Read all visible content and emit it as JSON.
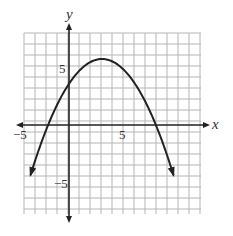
{
  "chart_data": {
    "type": "line",
    "title": "",
    "xlabel": "x",
    "ylabel": "y",
    "xlim": [
      -5,
      10
    ],
    "ylim": [
      -8,
      8
    ],
    "grid": true,
    "x_tick_labels": [
      {
        "value": -5,
        "label": "−5"
      },
      {
        "value": 5,
        "label": "5"
      }
    ],
    "y_tick_labels": [
      {
        "value": 5,
        "label": "5"
      },
      {
        "value": -5,
        "label": "−5"
      }
    ],
    "series": [
      {
        "name": "parabola",
        "equation": "y = -0.25(x - 3)^2 + 6",
        "vertex": [
          3,
          6
        ],
        "y_intercept": 3.75,
        "x_intercepts": [
          -1.9,
          7.9
        ],
        "endpoints_with_arrows": [
          [
            -3.5,
            -4.6
          ],
          [
            9.5,
            -4.6
          ]
        ],
        "x": [
          -3.5,
          -3,
          -2,
          -1,
          0,
          1,
          2,
          3,
          4,
          5,
          6,
          7,
          8,
          9,
          9.5
        ],
        "y": [
          -4.56,
          -3,
          -0.25,
          2,
          3.75,
          5,
          5.75,
          6,
          5.75,
          5,
          3.75,
          2,
          -0.25,
          -3,
          -4.56
        ]
      }
    ]
  },
  "labels": {
    "x_axis": "x",
    "y_axis": "y",
    "x_neg5": "−5",
    "x_pos5": "5",
    "y_pos5": "5",
    "y_neg5": "−5"
  },
  "colors": {
    "grid": "#b5b5b5",
    "axis": "#222222",
    "curve": "#222222"
  }
}
